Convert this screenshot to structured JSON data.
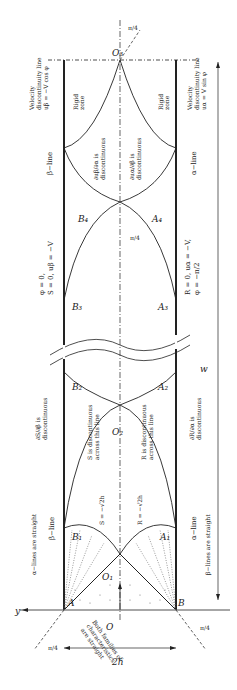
{
  "diagram": {
    "type": "slip-line field (rotated 90deg)",
    "orientation": "rotated -90 degrees; y-axis points left at bottom",
    "colors": {
      "stroke": "#222222",
      "background": "#ffffff",
      "dotted": "#555555"
    },
    "points": {
      "A": "A",
      "B": "B",
      "O": "O",
      "O1": "O₁",
      "O2": "O₂",
      "O3": "O₃",
      "A1": "A₁",
      "A2": "A₂",
      "A3": "A₃",
      "A4": "A₄",
      "B1": "B₁",
      "B2": "B₂",
      "B3": "B₃",
      "B4": "B₄"
    },
    "axes": {
      "y": "y",
      "x": "x"
    },
    "dimensions": {
      "width": "2h",
      "length": "w"
    },
    "angles": {
      "pi4_top": "π/4",
      "pi4_left": "π/4",
      "pi4_right": "π/4",
      "pi4_mid": "π/4"
    },
    "labels": {
      "rigid_zone_left": [
        "Rigid",
        "zone"
      ],
      "rigid_zone_right": [
        "Rigid",
        "zone"
      ],
      "vel_disc_left": [
        "Velocity",
        "discontinuity line",
        "uβ = −V cos φ"
      ],
      "vel_disc_right": [
        "Velocity",
        "discontinuity line",
        "uα = V sin φ"
      ],
      "beta_line_top": "β−line",
      "alpha_line_top": "α−line",
      "dub_disc": [
        "∂uβ/∂α is",
        "discontinuous"
      ],
      "dua_disc": [
        "∂uα/∂β is",
        "discontinuous"
      ],
      "left_state": [
        "φ = 0,",
        "S = 0, uβ = −V"
      ],
      "right_state": [
        "R = 0, uα = −V,",
        "φ = −π/2"
      ],
      "dS_disc": [
        "∂S/∂β is",
        "discontinuous"
      ],
      "dR_disc": [
        "∂R/∂α is",
        "discontinuous"
      ],
      "S_disc": [
        "S is discontinuous",
        "across this line"
      ],
      "R_disc": [
        "R is discontinuous",
        "across this line"
      ],
      "S_val": "S = −√2h",
      "R_val": "R = −√2h",
      "alpha_straight": "α−lines are straight",
      "beta_straight": "β−lines are straight",
      "beta_line_bottom": "β−line",
      "alpha_line_bottom": "α−line",
      "both_families": [
        "Both families of",
        "characteristics",
        "are straight"
      ]
    }
  }
}
